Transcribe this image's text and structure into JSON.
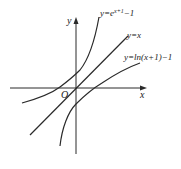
{
  "diagram": {
    "type": "function-graph",
    "axes": {
      "x_label": "x",
      "y_label": "y",
      "origin_label": "O"
    },
    "curves": [
      {
        "id": "exp",
        "label_main": "y=e",
        "label_sup": "x+1",
        "label_tail": "−1"
      },
      {
        "id": "identity",
        "label": "y=x"
      },
      {
        "id": "log",
        "label": "y=ln(x+1)−1"
      }
    ],
    "colors": {
      "stroke": "#2a2a2a",
      "background": "#ffffff"
    }
  }
}
